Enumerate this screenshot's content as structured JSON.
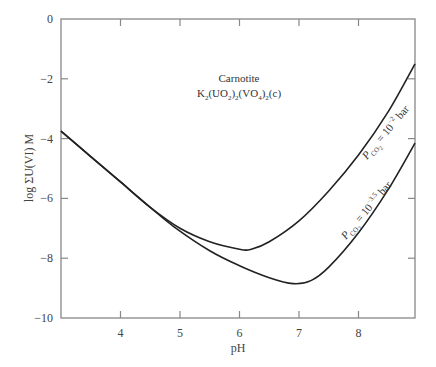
{
  "chart_data": {
    "type": "line",
    "title": "",
    "xlabel": "pH",
    "ylabel": "log ΣU(VI) M",
    "xlim": [
      3,
      8.95
    ],
    "ylim": [
      -10,
      0
    ],
    "xticks": [
      4,
      5,
      6,
      7,
      8
    ],
    "yticks": [
      0,
      -2,
      -4,
      -6,
      -8,
      -10
    ],
    "xtick_labels": [
      "4",
      "5",
      "6",
      "7",
      "8"
    ],
    "ytick_labels": [
      "0",
      "−2",
      "−4",
      "−6",
      "−8",
      "−10"
    ],
    "grid": false,
    "legend": "none (inline curve labels)",
    "annotations": [
      {
        "text": "Carnotite",
        "x": 6.0,
        "y": -2.05
      },
      {
        "text": "K2(UO2)2(VO4)2(c)",
        "x": 6.0,
        "y": -2.55
      }
    ],
    "series": [
      {
        "name": "PCO2 = 10^-2 bar",
        "x": [
          3.0,
          3.5,
          4.0,
          4.5,
          5.0,
          5.5,
          6.0,
          6.2,
          6.5,
          7.0,
          7.5,
          8.0,
          8.5,
          8.95
        ],
        "y": [
          -3.75,
          -4.6,
          -5.45,
          -6.3,
          -7.0,
          -7.45,
          -7.7,
          -7.7,
          -7.45,
          -6.75,
          -5.75,
          -4.55,
          -3.1,
          -1.5
        ]
      },
      {
        "name": "PCO2 = 10^-3.5 bar",
        "x": [
          3.0,
          3.5,
          4.0,
          4.5,
          4.9,
          5.5,
          6.0,
          6.5,
          6.9,
          7.2,
          7.5,
          8.0,
          8.5,
          8.95
        ],
        "y": [
          -3.75,
          -4.6,
          -5.45,
          -6.3,
          -6.95,
          -7.75,
          -8.25,
          -8.65,
          -8.85,
          -8.75,
          -8.3,
          -7.15,
          -5.7,
          -4.15
        ]
      }
    ]
  },
  "labels": {
    "annotation_line1": "Carnotite",
    "annotation_line2_main": "K",
    "xlabel": "pH",
    "ylabel": "log ΣU(VI) M",
    "curve1_prefix": "P",
    "curve1_sub": "CO",
    "curve1_eq": " = 10",
    "curve1_exp": "−2",
    "curve1_unit": " bar",
    "curve2_prefix": "P",
    "curve2_sub": "CO",
    "curve2_eq": " = 10",
    "curve2_exp": "−3.5",
    "curve2_unit": " bar"
  }
}
